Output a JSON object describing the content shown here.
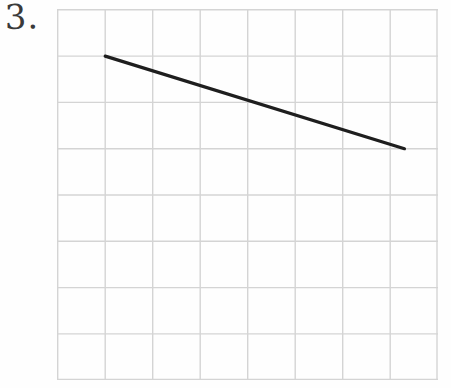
{
  "page": {
    "background_color": "#fefefe",
    "width": 451,
    "height": 388
  },
  "problem": {
    "number_label": "3.",
    "ink_color": "#3a3a3a"
  },
  "graph": {
    "grid": {
      "columns": 8,
      "rows": 8,
      "cell_width": 47.5,
      "cell_height": 46.3,
      "line_color": "#d4d4d4",
      "border_color": "#cfcfcf",
      "line_width": 1.4
    },
    "plot": {
      "line_color": "#1e1e1e",
      "line_width": 3.2,
      "cap": "round"
    }
  },
  "chart_data": {
    "type": "line",
    "title": "",
    "xlabel": "",
    "ylabel": "",
    "grid": true,
    "legend": null,
    "xlim": [
      0,
      8
    ],
    "ylim": [
      0,
      8
    ],
    "xticks": [
      0,
      1,
      2,
      3,
      4,
      5,
      6,
      7,
      8
    ],
    "yticks": [
      0,
      1,
      2,
      3,
      4,
      5,
      6,
      7,
      8
    ],
    "xticklabels": [
      "",
      "",
      "",
      "",
      "",
      "",
      "",
      "",
      ""
    ],
    "yticklabels": [
      "",
      "",
      "",
      "",
      "",
      "",
      "",
      "",
      ""
    ],
    "series": [
      {
        "name": "segment",
        "x": [
          1,
          7.3
        ],
        "y": [
          7,
          5
        ],
        "slope": -0.317,
        "endpoints_grid": [
          {
            "col": 1,
            "row": 1
          },
          {
            "col": 7.3,
            "row": 3
          }
        ]
      }
    ],
    "annotations": []
  }
}
